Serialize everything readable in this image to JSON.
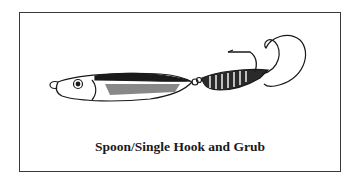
{
  "figure": {
    "caption": "Spoon/Single Hook and Grub",
    "illustration": "spoon-lure-with-single-hook-and-curly-tail-grub"
  }
}
